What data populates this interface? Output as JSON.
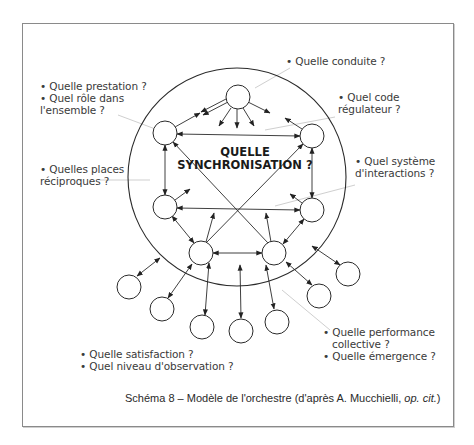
{
  "diagram": {
    "center_title_line1": "QUELLE",
    "center_title_line2": "SYNCHRONISATION ?",
    "labels": {
      "top": {
        "line1": "• Quelle conduite ?"
      },
      "top_right": {
        "line1": "• Quel code",
        "line2": "régulateur ?"
      },
      "right": {
        "line1": "• Quel système",
        "line2": "d'interactions ?"
      },
      "top_left": {
        "line1": "• Quelle prestation ?",
        "line2": "• Quel rôle dans",
        "line3": "l'ensemble ?"
      },
      "left": {
        "line1": "• Quelles places",
        "line2": "réciproques ?"
      },
      "bottom_right": {
        "line1": "• Quelle performance",
        "line2": "collective ?",
        "line3": "• Quelle émergence ?"
      },
      "bottom_left": {
        "line1": "• Quelle satisfaction ?",
        "line2": "• Quel niveau d'observation ?"
      }
    },
    "caption": {
      "text": "Schéma 8 – Modèle de l'orchestre (d'après A. Mucchielli, ",
      "italic": "op. cit.",
      "close": ")"
    },
    "nodes": {
      "inner": [
        "top",
        "upper-left",
        "upper-right",
        "lower-left",
        "lower-right",
        "bottom-left",
        "bottom-right"
      ],
      "outer_count": 7
    },
    "colors": {
      "stroke": "#2a2a2a",
      "leader": "#cccccc",
      "frame": "#8a8a8a"
    }
  }
}
